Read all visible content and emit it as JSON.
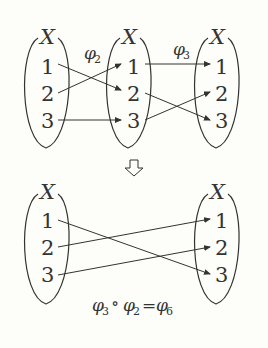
{
  "top": {
    "sets": [
      {
        "label": "X",
        "elements": [
          "1",
          "2",
          "3"
        ]
      },
      {
        "label": "X",
        "elements": [
          "1",
          "2",
          "3"
        ]
      },
      {
        "label": "X",
        "elements": [
          "1",
          "2",
          "3"
        ]
      }
    ],
    "map1": {
      "symbol": "φ",
      "subscript": "2"
    },
    "map2": {
      "symbol": "φ",
      "subscript": "3"
    }
  },
  "bottom": {
    "sets": [
      {
        "label": "X",
        "elements": [
          "1",
          "2",
          "3"
        ]
      },
      {
        "label": "X",
        "elements": [
          "1",
          "2",
          "3"
        ]
      }
    ],
    "equation": {
      "a": "φ",
      "a_sub": "3",
      "op": "∘",
      "b": "φ",
      "b_sub": "2",
      "eq": "=",
      "c": "φ",
      "c_sub": "6"
    }
  }
}
